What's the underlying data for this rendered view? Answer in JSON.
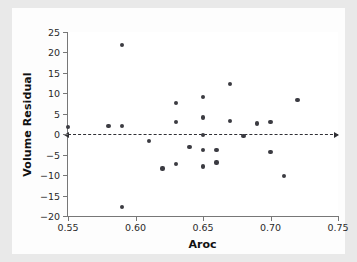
{
  "chart_data": {
    "type": "scatter",
    "title": "",
    "xlabel": "Aroc",
    "ylabel": "Volume Residual",
    "xlim": [
      0.55,
      0.75
    ],
    "ylim": [
      -20,
      25
    ],
    "xticks": [
      0.55,
      0.6,
      0.65,
      0.7,
      0.75
    ],
    "xtick_labels": [
      "0.55",
      "0.60",
      "0.65",
      "0.70",
      "0.75"
    ],
    "yticks": [
      -20,
      -15,
      -10,
      -5,
      0,
      5,
      10,
      15,
      20,
      25
    ],
    "ytick_labels": [
      "−20",
      "−15",
      "−10",
      "−5",
      "0",
      "5",
      "10",
      "15",
      "20",
      "25"
    ],
    "grid": false,
    "legend": null,
    "reference_line": {
      "type": "horizontal-dashed",
      "y": 0,
      "style": "dashed",
      "arrows": "both",
      "color": "#2f2f34"
    },
    "marker": {
      "shape": "circle",
      "color": "#3b3b42",
      "size": 4.2
    },
    "points": [
      {
        "x": 0.55,
        "y": 1.7
      },
      {
        "x": 0.58,
        "y": 2.1
      },
      {
        "x": 0.59,
        "y": 21.9
      },
      {
        "x": 0.59,
        "y": 2.1
      },
      {
        "x": 0.59,
        "y": -17.8
      },
      {
        "x": 0.61,
        "y": -1.7
      },
      {
        "x": 0.62,
        "y": -8.4
      },
      {
        "x": 0.63,
        "y": 7.7
      },
      {
        "x": 0.63,
        "y": 2.9
      },
      {
        "x": 0.63,
        "y": -7.2
      },
      {
        "x": 0.64,
        "y": -3.1
      },
      {
        "x": 0.65,
        "y": 9.1
      },
      {
        "x": 0.65,
        "y": 4.1
      },
      {
        "x": 0.65,
        "y": -0.1
      },
      {
        "x": 0.65,
        "y": -3.8
      },
      {
        "x": 0.65,
        "y": -7.9
      },
      {
        "x": 0.66,
        "y": -3.8
      },
      {
        "x": 0.66,
        "y": -6.9
      },
      {
        "x": 0.67,
        "y": 12.3
      },
      {
        "x": 0.67,
        "y": 3.3
      },
      {
        "x": 0.68,
        "y": -0.4
      },
      {
        "x": 0.69,
        "y": 2.6
      },
      {
        "x": 0.7,
        "y": 3.0
      },
      {
        "x": 0.7,
        "y": -4.3
      },
      {
        "x": 0.71,
        "y": -10.2
      },
      {
        "x": 0.72,
        "y": 8.3
      }
    ]
  },
  "colors": {
    "figure_background": "#e9e9e9",
    "canvas_background": "#fdfdfd",
    "plot_background": "#ffffff",
    "axis": "#777777",
    "text": "#111111",
    "marker": "#3b3b42"
  }
}
